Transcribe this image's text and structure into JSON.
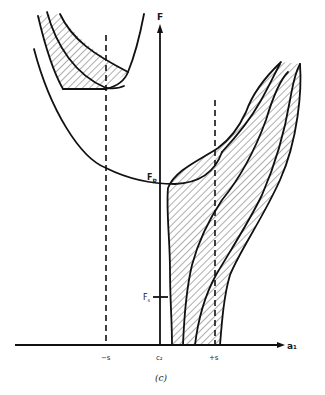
{
  "figure": {
    "caption": "(c)",
    "axes": {
      "y_label": "F",
      "x_label": "a₁",
      "x_ticks": [
        "−s",
        "c₂",
        "+s"
      ]
    },
    "annotations": {
      "peak_force": "F",
      "peak_force_sub": "p",
      "static_force": "F",
      "static_force_sub": "s"
    },
    "elements": {
      "parabola": "large U-shaped curve with minimum near F_p",
      "upper_left_region": "hatched region bounded by three curves and flat line at dashed line −s",
      "lower_right_region": "hatched region spanning from a₁ axis up to upper right, crossing dashed line +s",
      "dashed_lines": [
        "−s",
        "+s"
      ]
    },
    "colors": {
      "ink": "#111111",
      "background": "#ffffff"
    }
  }
}
